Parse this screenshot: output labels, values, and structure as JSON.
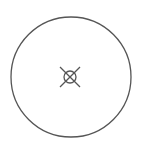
{
  "diagram": {
    "shape": "circle",
    "outer_circle": {
      "cx": 71,
      "cy": 77,
      "r": 60,
      "stroke": "#555555"
    },
    "center_marker": {
      "icon": "crossed-circle-icon",
      "cx": 70,
      "cy": 77,
      "r": 6,
      "arm": 10,
      "stroke": "#555555"
    }
  }
}
